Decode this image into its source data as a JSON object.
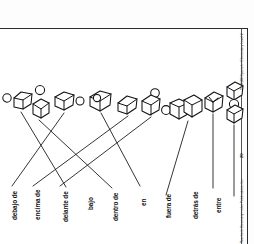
{
  "worksheet": {
    "language": "Spanish",
    "topic": "preposiciones de lugar",
    "page_number": "20",
    "header_text": "TX-0100 Spanish • Elementary Level 2",
    "footer_text": "Teacher's Discovery • nder Publications, Inc.",
    "border_color": "#2b2b2b",
    "ink_color": "#111111",
    "paper_color": "#ffffff"
  },
  "labels": [
    {
      "id": "debajo-de",
      "text": "debajo de"
    },
    {
      "id": "encima-de",
      "text": "encima de"
    },
    {
      "id": "delante-de",
      "text": "delante de"
    },
    {
      "id": "bajo",
      "text": "bajo"
    },
    {
      "id": "dentro-de",
      "text": "dentro de"
    },
    {
      "id": "en",
      "text": "en"
    },
    {
      "id": "fuera-de",
      "text": "fuera de"
    },
    {
      "id": "detras-de",
      "text": "detrás de"
    },
    {
      "id": "entre",
      "text": "entre"
    }
  ],
  "figures": [
    {
      "id": "fig-1",
      "description": "ball left of cube"
    },
    {
      "id": "fig-2",
      "description": "ball above cube"
    },
    {
      "id": "fig-3",
      "description": "cube with ball at right"
    },
    {
      "id": "fig-4",
      "description": "ball inside open cube"
    },
    {
      "id": "fig-5",
      "description": "small cube tilted"
    },
    {
      "id": "fig-6",
      "description": "ball on top corner of cube"
    },
    {
      "id": "fig-7",
      "description": "ball beside two stacked cubes"
    },
    {
      "id": "fig-8",
      "description": "ball behind cube"
    },
    {
      "id": "fig-9",
      "description": "ball between two cubes"
    }
  ],
  "matching_lines": [
    {
      "from": "fig-1",
      "to": "bajo"
    },
    {
      "from": "fig-2",
      "to": "dentro-de"
    },
    {
      "from": "fig-3",
      "to": "debajo-de"
    },
    {
      "from": "fig-4",
      "to": "en"
    },
    {
      "from": "fig-5",
      "to": "encima-de"
    },
    {
      "from": "fig-6",
      "to": "delante-de"
    },
    {
      "from": "fig-7",
      "to": "fuera-de"
    },
    {
      "from": "fig-8",
      "to": "detras-de"
    },
    {
      "from": "fig-9",
      "to": "entre"
    }
  ]
}
